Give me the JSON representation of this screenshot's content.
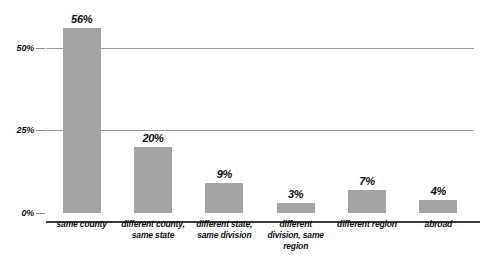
{
  "chart_data": {
    "type": "bar",
    "title": "",
    "subtitle": "",
    "xlabel": "",
    "ylabel": "",
    "ylim": [
      0,
      62
    ],
    "grid": true,
    "legend": false,
    "orientation": "vertical",
    "bar_color": "#a3a3a3",
    "categories": [
      "same county",
      "different county, same state",
      "different state, same division",
      "different division, same region",
      "different region",
      "abroad"
    ],
    "values": [
      56,
      20,
      9,
      3,
      7,
      4
    ],
    "value_labels": [
      "56%",
      "20%",
      "9%",
      "3%",
      "7%",
      "4%"
    ],
    "yticks": [
      0,
      25,
      50
    ],
    "ytick_labels": [
      "0%",
      "25%",
      "50%"
    ],
    "series": [
      {
        "name": "Share of movers",
        "values": [
          56,
          20,
          9,
          3,
          7,
          4
        ]
      }
    ]
  },
  "axis": {
    "y": {
      "ticks": [
        {
          "label": "50%",
          "value": 50
        },
        {
          "label": "25%",
          "value": 25
        },
        {
          "label": "0%",
          "value": 0
        }
      ]
    },
    "x": {
      "labels": [
        "same county",
        "different county, same state",
        "different state, same division",
        "different division, same region",
        "different region",
        "abroad"
      ]
    }
  },
  "colors": {
    "bar": "#a3a3a3",
    "gridline": "#9a9a9a",
    "baseline": "#3a3a3a",
    "text": "#101010",
    "background": "#ffffff"
  }
}
